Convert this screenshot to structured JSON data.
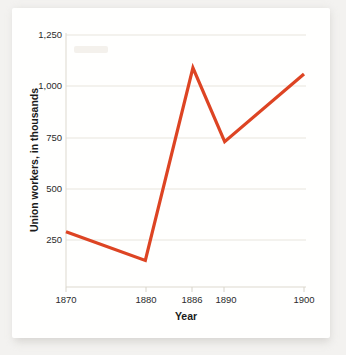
{
  "chart_data": {
    "type": "line",
    "title": "",
    "xlabel": "Year",
    "ylabel": "Union workers, in thousands",
    "x": [
      1870,
      1880,
      1886,
      1890,
      1900
    ],
    "values": [
      290,
      150,
      1090,
      730,
      1060
    ],
    "series": [
      {
        "name": "Union workers",
        "values": [
          290,
          150,
          1090,
          730,
          1060
        ],
        "color": "#dd4423"
      }
    ],
    "xtick_labels": [
      "1870",
      "1880",
      "1886",
      "1890",
      "1900"
    ],
    "ytick_labels": [
      "250",
      "500",
      "750",
      "1,000",
      "1,250"
    ],
    "ytick_values": [
      250,
      500,
      750,
      1000,
      1250
    ],
    "xlim": [
      1866,
      1903
    ],
    "ylim": [
      0,
      1310
    ],
    "grid": "horizontal",
    "legend": "none"
  },
  "axes": {
    "x_title": "Year",
    "y_title": "Union workers, in thousands",
    "x_labels": {
      "t0": "1870",
      "t1": "1880",
      "t2": "1886",
      "t3": "1890",
      "t4": "1900"
    },
    "y_labels": {
      "t0": "250",
      "t1": "500",
      "t2": "750",
      "t3": "1,000",
      "t4": "1,250"
    }
  },
  "style": {
    "line_color": "#dd4423",
    "grid_color": "#e8e5dd",
    "text_color": "#2b2b2b",
    "card_background": "#fffffe",
    "page_background": "#f3f2f0"
  }
}
